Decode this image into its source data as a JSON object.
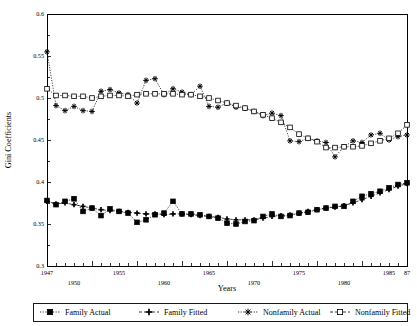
{
  "chart_data": {
    "type": "line",
    "title": "",
    "xlabel": "Years",
    "ylabel": "Gini Coefficients",
    "xlim": [
      1947,
      1987
    ],
    "ylim": [
      0.3,
      0.6
    ],
    "yticks": [
      "0.3",
      "0.35",
      "0.4",
      "0.45",
      "0.5",
      "0.55",
      "0.6"
    ],
    "ytick_values": [
      0.3,
      0.35,
      0.4,
      0.45,
      0.5,
      0.55,
      0.6
    ],
    "xtick_labels_upper": [
      "1947",
      "1955",
      "1965",
      "1975",
      "1985",
      "87"
    ],
    "xtick_values_upper": [
      1947,
      1955,
      1965,
      1975,
      1985,
      1987
    ],
    "xtick_labels_lower": [
      "1950",
      "1960",
      "1970",
      "1980"
    ],
    "xtick_values_lower": [
      1950,
      1960,
      1970,
      1980
    ],
    "grid": false,
    "legend_position": "below-plot",
    "x": [
      1947,
      1948,
      1949,
      1950,
      1951,
      1952,
      1953,
      1954,
      1955,
      1956,
      1957,
      1958,
      1959,
      1960,
      1961,
      1962,
      1963,
      1964,
      1965,
      1966,
      1967,
      1968,
      1969,
      1970,
      1971,
      1972,
      1973,
      1974,
      1975,
      1976,
      1977,
      1978,
      1979,
      1980,
      1981,
      1982,
      1983,
      1984,
      1985,
      1986,
      1987
    ],
    "series": [
      {
        "name": "Family Actual",
        "marker": "filled-square",
        "line": "dotted",
        "values": [
          0.378,
          0.373,
          0.377,
          0.38,
          0.365,
          0.369,
          0.36,
          0.368,
          0.365,
          0.363,
          0.352,
          0.355,
          0.361,
          0.363,
          0.377,
          0.362,
          0.362,
          0.361,
          0.359,
          0.357,
          0.351,
          0.35,
          0.353,
          0.354,
          0.359,
          0.362,
          0.359,
          0.36,
          0.363,
          0.364,
          0.367,
          0.369,
          0.371,
          0.371,
          0.377,
          0.383,
          0.386,
          0.389,
          0.393,
          0.397,
          0.399
        ]
      },
      {
        "name": "Family Fitted",
        "marker": "plus",
        "line": "dashed",
        "values": [
          0.377,
          0.374,
          0.375,
          0.373,
          0.371,
          0.369,
          0.367,
          0.366,
          0.365,
          0.364,
          0.363,
          0.362,
          0.362,
          0.361,
          0.362,
          0.362,
          0.361,
          0.36,
          0.359,
          0.358,
          0.356,
          0.355,
          0.355,
          0.355,
          0.357,
          0.359,
          0.36,
          0.361,
          0.363,
          0.365,
          0.367,
          0.369,
          0.37,
          0.372,
          0.375,
          0.379,
          0.383,
          0.387,
          0.391,
          0.395,
          0.398
        ]
      },
      {
        "name": "Nonfamily Actual",
        "marker": "asterisk",
        "line": "dotted",
        "values": [
          0.555,
          0.491,
          0.485,
          0.49,
          0.485,
          0.484,
          0.508,
          0.51,
          0.506,
          0.504,
          0.494,
          0.521,
          0.523,
          0.504,
          0.511,
          0.507,
          0.504,
          0.514,
          0.49,
          0.489,
          0.494,
          0.489,
          0.488,
          0.484,
          0.479,
          0.482,
          0.479,
          0.449,
          0.448,
          0.452,
          0.449,
          0.447,
          0.43,
          0.442,
          0.449,
          0.447,
          0.456,
          0.458,
          0.45,
          0.454,
          0.456
        ]
      },
      {
        "name": "Nonfamily Fitted",
        "marker": "open-square",
        "line": "dotted",
        "values": [
          0.511,
          0.503,
          0.503,
          0.502,
          0.502,
          0.5,
          0.502,
          0.503,
          0.503,
          0.502,
          0.504,
          0.505,
          0.505,
          0.505,
          0.505,
          0.504,
          0.504,
          0.502,
          0.5,
          0.497,
          0.494,
          0.491,
          0.488,
          0.484,
          0.48,
          0.476,
          0.471,
          0.465,
          0.457,
          0.452,
          0.448,
          0.441,
          0.441,
          0.442,
          0.442,
          0.443,
          0.446,
          0.449,
          0.452,
          0.458,
          0.468
        ]
      }
    ]
  },
  "axes": {
    "x_title": "Years",
    "y_title": "Gini Coefficients"
  },
  "legend": {
    "items": [
      {
        "label": "Family Actual",
        "marker": "filled-square",
        "line": "dotted"
      },
      {
        "label": "Family Fitted",
        "marker": "plus",
        "line": "dashed"
      },
      {
        "label": "Nonfamily Actual",
        "marker": "asterisk",
        "line": "dotted"
      },
      {
        "label": "Nonfamily Fitted",
        "marker": "open-square",
        "line": "dashed"
      }
    ]
  }
}
